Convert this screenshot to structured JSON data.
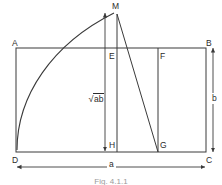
{
  "figure": {
    "caption": "Fig. 4.1.1",
    "line_color": "#3a3a3a",
    "text_color": "#2b2b2b",
    "background": "#ffffff",
    "vertices": [
      {
        "name": "A",
        "label": "A",
        "x": 12,
        "y": 39
      },
      {
        "name": "B",
        "label": "B",
        "x": 206,
        "y": 39
      },
      {
        "name": "C",
        "label": "C",
        "x": 206,
        "y": 156
      },
      {
        "name": "D",
        "label": "D",
        "x": 12,
        "y": 156
      },
      {
        "name": "M",
        "label": "M",
        "x": 112,
        "y": 2
      },
      {
        "name": "E",
        "label": "E",
        "x": 109,
        "y": 52
      },
      {
        "name": "F",
        "label": "F",
        "x": 160,
        "y": 52
      },
      {
        "name": "H",
        "label": "H",
        "x": 109,
        "y": 141
      },
      {
        "name": "G",
        "label": "G",
        "x": 160,
        "y": 141
      }
    ],
    "dimensions": [
      {
        "name": "width",
        "label": "a",
        "x": 107,
        "y": 160
      },
      {
        "name": "height",
        "label": "b",
        "x": 212,
        "y": 93
      }
    ],
    "annotations": [
      {
        "name": "geometric-mean",
        "symbol": "√",
        "argument": "ab",
        "x": 88,
        "y": 94
      }
    ]
  }
}
